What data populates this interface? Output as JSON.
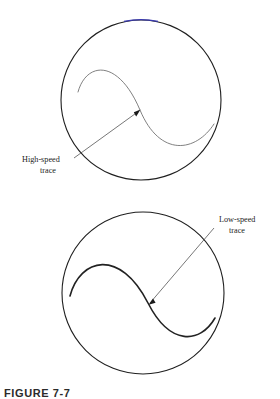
{
  "figure": {
    "caption": "FIGURE 7-7",
    "panels": [
      {
        "id": "upper-panel",
        "name": "high-speed-panel",
        "circle": {
          "cx": 141,
          "cy": 100,
          "r": 80,
          "stroke": "#1f1f1f"
        },
        "highlight_arc_color": "#3a3ab0",
        "trace": {
          "label_line1": "High-speed",
          "label_line2": "trace",
          "stroke": "#6a6a6a",
          "stroke_width": 0.8,
          "path": "M 78 92 C 86 62, 118 58, 140 110 C 160 158, 196 152, 214 124"
        },
        "leader": {
          "from_x": 74,
          "from_y": 158,
          "to_x": 139,
          "to_y": 111,
          "stroke": "#4a4a4a"
        },
        "label_x": 22,
        "label_y": 162
      },
      {
        "id": "lower-panel",
        "name": "low-speed-panel",
        "circle": {
          "cx": 143,
          "cy": 293,
          "r": 81,
          "stroke": "#1f1f1f"
        },
        "trace": {
          "label_line1": "Low-speed",
          "label_line2": "trace",
          "stroke": "#222222",
          "stroke_width": 1.5,
          "path": "M 70 296 C 80 258, 120 248, 148 303 C 170 346, 200 344, 215 318"
        },
        "leader": {
          "from_x": 214,
          "from_y": 228,
          "to_x": 149,
          "to_y": 304,
          "stroke": "#4a4a4a"
        },
        "label_x": 219,
        "label_y": 222
      }
    ]
  }
}
